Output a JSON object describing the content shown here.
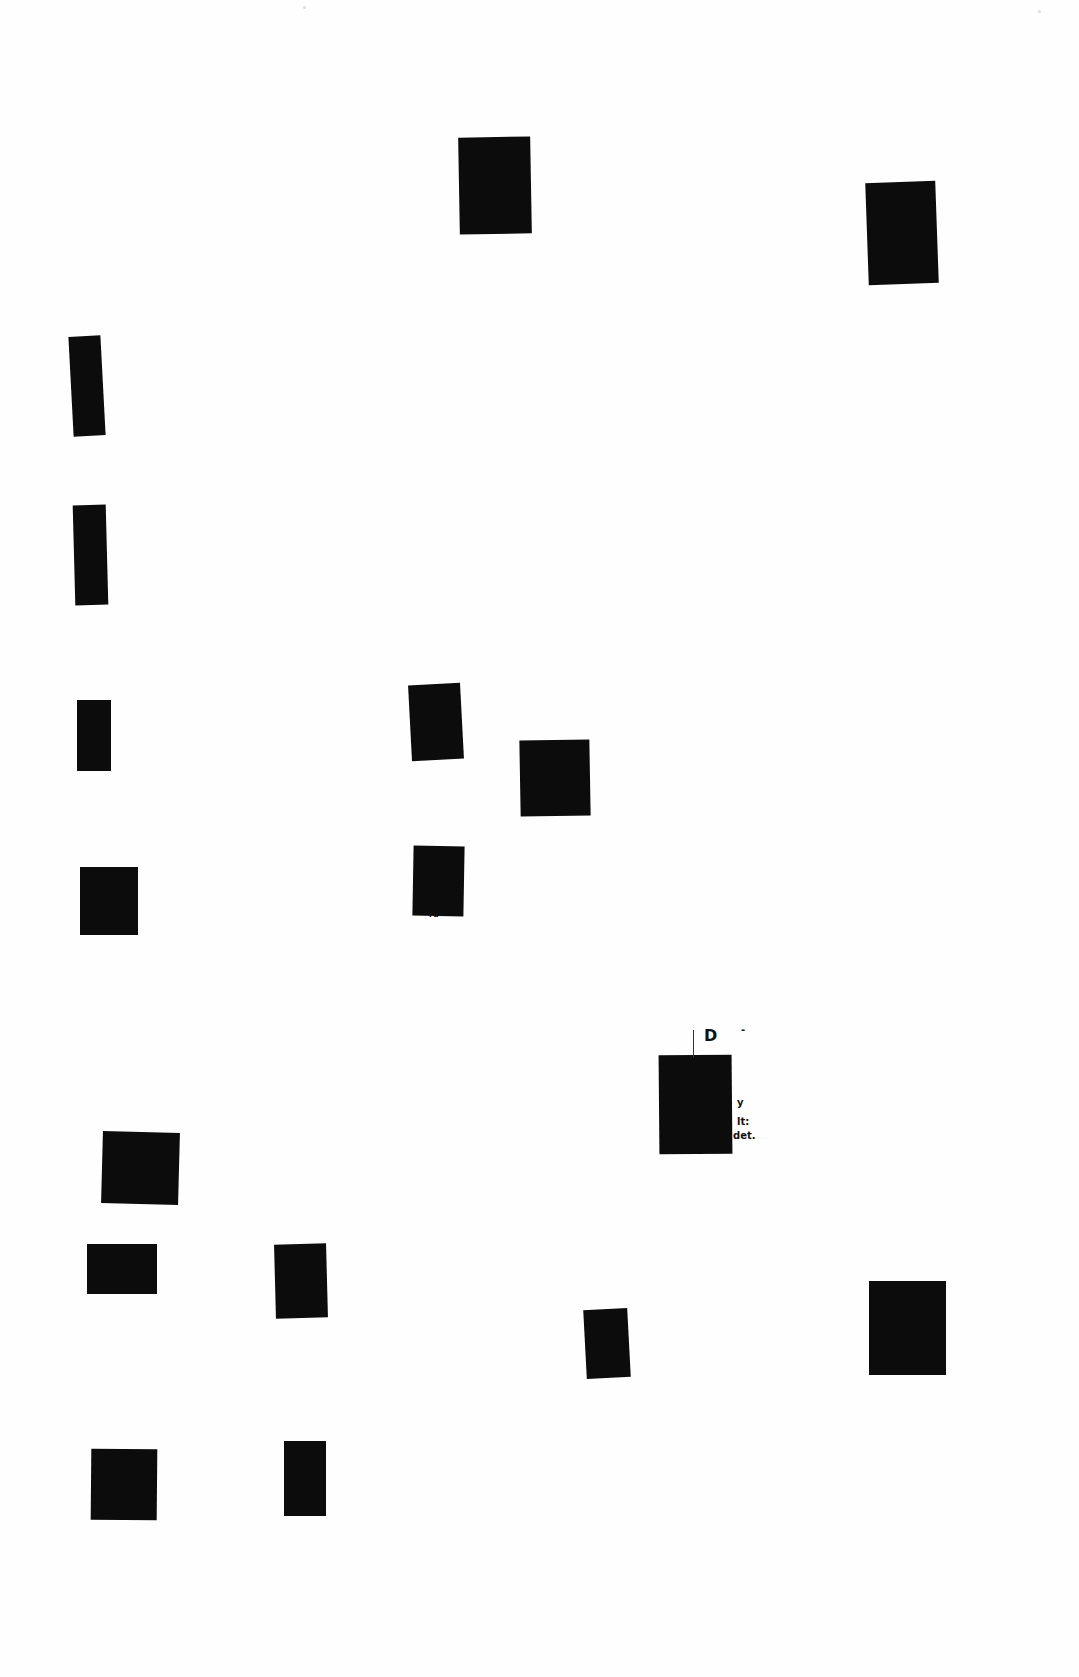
{
  "page": {
    "background": "#fefefe",
    "redaction_color": "#0c0c0c"
  },
  "redactions": [
    {
      "id": "r1",
      "x": 459,
      "y": 137,
      "w": 72,
      "h": 97,
      "rot": -1.0
    },
    {
      "id": "r2",
      "x": 867,
      "y": 182,
      "w": 70,
      "h": 102,
      "rot": -2.0
    },
    {
      "id": "r3",
      "x": 71,
      "y": 336,
      "w": 32,
      "h": 100,
      "rot": -3.0
    },
    {
      "id": "r4",
      "x": 74,
      "y": 505,
      "w": 33,
      "h": 100,
      "rot": -1.5
    },
    {
      "id": "r5",
      "x": 77,
      "y": 700,
      "w": 34,
      "h": 71,
      "rot": 0
    },
    {
      "id": "r6",
      "x": 410,
      "y": 684,
      "w": 52,
      "h": 76,
      "rot": -3.0
    },
    {
      "id": "r7",
      "x": 520,
      "y": 740,
      "w": 70,
      "h": 76,
      "rot": -1.0
    },
    {
      "id": "r8",
      "x": 80,
      "y": 867,
      "w": 58,
      "h": 68,
      "rot": 0
    },
    {
      "id": "r9",
      "x": 413,
      "y": 846,
      "w": 51,
      "h": 70,
      "rot": 1.0
    },
    {
      "id": "r10",
      "x": 659,
      "y": 1055,
      "w": 73,
      "h": 99,
      "rot": -0.5
    },
    {
      "id": "r11",
      "x": 102,
      "y": 1132,
      "w": 77,
      "h": 72,
      "rot": 1.5
    },
    {
      "id": "r12",
      "x": 87,
      "y": 1244,
      "w": 70,
      "h": 50,
      "rot": 0
    },
    {
      "id": "r13",
      "x": 275,
      "y": 1244,
      "w": 52,
      "h": 74,
      "rot": -1.5
    },
    {
      "id": "r14",
      "x": 585,
      "y": 1309,
      "w": 44,
      "h": 69,
      "rot": -3.0
    },
    {
      "id": "r15",
      "x": 869,
      "y": 1281,
      "w": 77,
      "h": 94,
      "rot": 0
    },
    {
      "id": "r16",
      "x": 91,
      "y": 1449,
      "w": 66,
      "h": 71,
      "rot": 0.5
    },
    {
      "id": "r17",
      "x": 284,
      "y": 1441,
      "w": 42,
      "h": 75,
      "rot": 0
    }
  ],
  "fragments": [
    {
      "id": "f1",
      "text": "D",
      "x": 704,
      "y": 1028,
      "size": 16
    },
    {
      "id": "f2",
      "text": "-",
      "x": 741,
      "y": 1025,
      "size": 10
    },
    {
      "id": "f3",
      "text": "y",
      "x": 737,
      "y": 1098,
      "size": 10
    },
    {
      "id": "f4",
      "text": "lt:",
      "x": 737,
      "y": 1117,
      "size": 10
    },
    {
      "id": "f5",
      "text": "det.",
      "x": 733,
      "y": 1131,
      "size": 10
    },
    {
      "id": "f6",
      "text": "ru",
      "x": 429,
      "y": 911,
      "size": 8
    }
  ],
  "ticks": [
    {
      "id": "t1",
      "x": 693,
      "y": 1030,
      "h": 28
    }
  ]
}
